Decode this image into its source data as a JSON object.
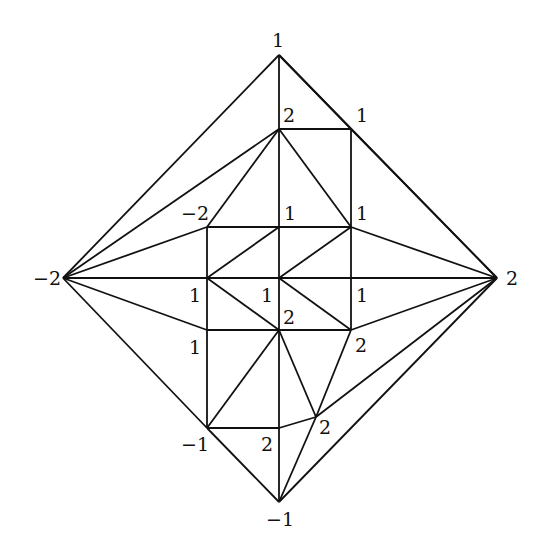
{
  "diagram": {
    "type": "triangulation",
    "stroke_color": "#111111",
    "background": "#ffffff",
    "vertices": [
      {
        "id": "top",
        "x": 279,
        "y": 55,
        "label": "1",
        "lx": 272,
        "ly": 47
      },
      {
        "id": "left",
        "x": 63,
        "y": 278,
        "label": "−2",
        "lx": 33,
        "ly": 285
      },
      {
        "id": "right",
        "x": 497,
        "y": 278,
        "label": "2",
        "lx": 506,
        "ly": 285
      },
      {
        "id": "bottom",
        "x": 279,
        "y": 502,
        "label": "−1",
        "lx": 266,
        "ly": 526
      },
      {
        "id": "a",
        "x": 279,
        "y": 129,
        "label": "2",
        "lx": 283,
        "ly": 122
      },
      {
        "id": "b",
        "x": 351,
        "y": 129,
        "label": "1",
        "lx": 356,
        "ly": 122
      },
      {
        "id": "c",
        "x": 207,
        "y": 227,
        "label": "−2",
        "lx": 181,
        "ly": 220
      },
      {
        "id": "d",
        "x": 279,
        "y": 227,
        "label": "1",
        "lx": 284,
        "ly": 220
      },
      {
        "id": "e",
        "x": 351,
        "y": 227,
        "label": "1",
        "lx": 356,
        "ly": 220
      },
      {
        "id": "f",
        "x": 207,
        "y": 278,
        "label": "1",
        "lx": 189,
        "ly": 302
      },
      {
        "id": "g",
        "x": 279,
        "y": 278,
        "label": "1",
        "lx": 261,
        "ly": 302
      },
      {
        "id": "h",
        "x": 351,
        "y": 278,
        "label": "1",
        "lx": 356,
        "ly": 302
      },
      {
        "id": "i",
        "x": 207,
        "y": 330,
        "label": "1",
        "lx": 189,
        "ly": 354
      },
      {
        "id": "j",
        "x": 279,
        "y": 330,
        "label": "2",
        "lx": 283,
        "ly": 324
      },
      {
        "id": "k",
        "x": 351,
        "y": 330,
        "label": "2",
        "lx": 355,
        "ly": 352
      },
      {
        "id": "l",
        "x": 207,
        "y": 428,
        "label": "−1",
        "lx": 181,
        "ly": 451
      },
      {
        "id": "m",
        "x": 279,
        "y": 428,
        "label": "2",
        "lx": 261,
        "ly": 451
      },
      {
        "id": "n",
        "x": 316,
        "y": 417,
        "label": "2",
        "lx": 319,
        "ly": 434
      }
    ],
    "edges": [
      [
        "top",
        "left"
      ],
      [
        "top",
        "right"
      ],
      [
        "top",
        "a"
      ],
      [
        "top",
        "b"
      ],
      [
        "b",
        "right"
      ],
      [
        "left",
        "a"
      ],
      [
        "left",
        "c"
      ],
      [
        "left",
        "f"
      ],
      [
        "left",
        "i"
      ],
      [
        "left",
        "l"
      ],
      [
        "l",
        "bottom"
      ],
      [
        "bottom",
        "right"
      ],
      [
        "bottom",
        "m"
      ],
      [
        "bottom",
        "n"
      ],
      [
        "a",
        "b"
      ],
      [
        "b",
        "e"
      ],
      [
        "a",
        "d"
      ],
      [
        "a",
        "c"
      ],
      [
        "a",
        "e"
      ],
      [
        "c",
        "d"
      ],
      [
        "d",
        "e"
      ],
      [
        "c",
        "f"
      ],
      [
        "d",
        "g"
      ],
      [
        "e",
        "h"
      ],
      [
        "f",
        "g"
      ],
      [
        "g",
        "h"
      ],
      [
        "h",
        "right"
      ],
      [
        "e",
        "right"
      ],
      [
        "f",
        "d"
      ],
      [
        "g",
        "e"
      ],
      [
        "f",
        "j"
      ],
      [
        "g",
        "k"
      ],
      [
        "f",
        "i"
      ],
      [
        "g",
        "j"
      ],
      [
        "h",
        "k"
      ],
      [
        "i",
        "j"
      ],
      [
        "j",
        "k"
      ],
      [
        "k",
        "right"
      ],
      [
        "i",
        "l"
      ],
      [
        "l",
        "j"
      ],
      [
        "j",
        "m"
      ],
      [
        "l",
        "m"
      ],
      [
        "m",
        "n"
      ],
      [
        "j",
        "n"
      ],
      [
        "k",
        "n"
      ],
      [
        "n",
        "right"
      ]
    ]
  }
}
